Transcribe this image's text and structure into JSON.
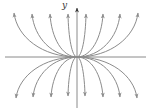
{
  "figure": {
    "type": "phase-portrait",
    "axis_label_y": "y",
    "colors": {
      "axis": "#8a8a8a",
      "trajectory": "#8c8c8c",
      "arrowhead_axis": "#333333",
      "background": "#ffffff"
    },
    "origin": [
      77,
      57
    ],
    "x_axis": {
      "from": [
        5,
        57
      ],
      "to": [
        146,
        57
      ]
    },
    "y_axis": {
      "from": [
        77,
        108
      ],
      "to": [
        77,
        6
      ]
    },
    "trajectories_upper": [
      {
        "tip": [
          14,
          13
        ]
      },
      {
        "tip": [
          32,
          14
        ]
      },
      {
        "tip": [
          50,
          14
        ]
      },
      {
        "tip": [
          68,
          14
        ]
      },
      {
        "tip": [
          86,
          14
        ]
      },
      {
        "tip": [
          103,
          14
        ]
      },
      {
        "tip": [
          120,
          14
        ]
      },
      {
        "tip": [
          138,
          13
        ]
      }
    ],
    "trajectories_lower": [
      {
        "tip": [
          16,
          98
        ]
      },
      {
        "tip": [
          33,
          97
        ]
      },
      {
        "tip": [
          51,
          97
        ]
      },
      {
        "tip": [
          68,
          96
        ]
      },
      {
        "tip": [
          85,
          96
        ]
      },
      {
        "tip": [
          103,
          97
        ]
      },
      {
        "tip": [
          120,
          97
        ]
      },
      {
        "tip": [
          137,
          98
        ]
      }
    ]
  }
}
